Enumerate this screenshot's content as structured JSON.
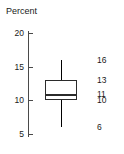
{
  "chart_data": {
    "type": "box",
    "title": "",
    "ylabel": "Percent",
    "xlabel": "",
    "ylim": [
      3.5,
      21.5
    ],
    "grid": false,
    "legend": null,
    "y_ticks": [
      {
        "label": "20",
        "value": 20
      },
      {
        "label": "15",
        "value": 15
      },
      {
        "label": "10",
        "value": 10
      },
      {
        "label": "5",
        "value": 5
      }
    ],
    "boxes": [
      {
        "name": "Percent",
        "min": 6,
        "q1": 10,
        "median": 11,
        "q3": 13,
        "max": 16
      }
    ],
    "annotations": [
      {
        "label": "16",
        "value": 16,
        "refers_to": "max"
      },
      {
        "label": "13",
        "value": 13,
        "refers_to": "q3"
      },
      {
        "label": "11",
        "value": 11,
        "refers_to": "median"
      },
      {
        "label": "10",
        "value": 10,
        "refers_to": "q1"
      },
      {
        "label": "6",
        "value": 6,
        "refers_to": "min"
      }
    ],
    "colors": {
      "axis": "#4a4a4a",
      "box_stroke": "#2b2b2b",
      "box_fill": "#ffffff",
      "whisker": "#000000",
      "text": "#1a1a1a",
      "background": "#ffffff"
    }
  }
}
